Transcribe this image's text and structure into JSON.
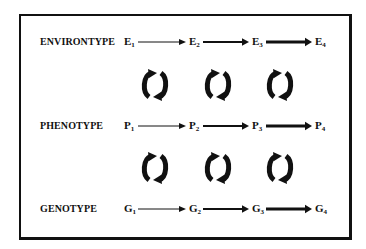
{
  "rows": [
    {
      "label": "ENVIRONTYPE",
      "symbol": "E",
      "y": 43,
      "nodes": [
        "1",
        "2",
        "3",
        "4"
      ]
    },
    {
      "label": "PHENOTYPE",
      "symbol": "P",
      "y": 127,
      "nodes": [
        "1",
        "2",
        "3",
        "4"
      ]
    },
    {
      "label": "GENOTYPE",
      "symbol": "G",
      "y": 210,
      "nodes": [
        "1",
        "2",
        "3",
        "4"
      ]
    }
  ],
  "node_x": [
    124,
    189,
    252,
    315
  ],
  "arrow_widths": [
    1,
    2,
    3
  ],
  "cycle_rows_y": [
    85,
    168
  ],
  "cycle_cols_x": [
    155,
    218,
    280
  ],
  "colors": {
    "ink": "#111111",
    "background": "#ffffff"
  },
  "icons": {
    "cycle": "circular-arrows-icon",
    "arrow": "right-arrow-icon"
  }
}
